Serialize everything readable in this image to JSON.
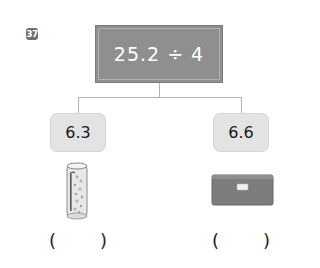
{
  "problem": {
    "number": "37",
    "expression": "25.2 ÷ 4"
  },
  "options": [
    {
      "value": "6.3",
      "image": "cylinder-container-icon",
      "answer_blank": {
        "open": "(",
        "close": ")",
        "value": ""
      }
    },
    {
      "value": "6.6",
      "image": "box-icon",
      "answer_blank": {
        "open": "(",
        "close": ")",
        "value": ""
      }
    }
  ],
  "colors": {
    "main_box": "#8f8f8f",
    "option_box": "#e3e3e3",
    "badge": "#6f6f6f",
    "connector": "#b3b3b3"
  }
}
